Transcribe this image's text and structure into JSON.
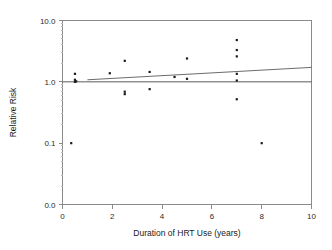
{
  "chart_data": {
    "type": "scatter",
    "title": "",
    "xlabel": "Duration of HRT Use (years)",
    "ylabel": "Relative Risk",
    "xlim": [
      0,
      10
    ],
    "ylim": [
      0.01,
      10.0
    ],
    "yscale": "log",
    "grid": false,
    "legend": null,
    "xticks": [
      0,
      2,
      4,
      6,
      8,
      10
    ],
    "xtick_labels": [
      "0",
      "2",
      "4",
      "6",
      "8",
      "10"
    ],
    "yticks": [
      10.0,
      1.0,
      0.1,
      0.01
    ],
    "ytick_labels": [
      "10.0",
      "1.0",
      "0.1",
      "0.0"
    ],
    "points": [
      {
        "x": 0.35,
        "y": 0.1
      },
      {
        "x": 0.5,
        "y": 1.35
      },
      {
        "x": 0.5,
        "y": 1.08
      },
      {
        "x": 0.5,
        "y": 1.0
      },
      {
        "x": 0.55,
        "y": 1.02
      },
      {
        "x": 1.9,
        "y": 1.38
      },
      {
        "x": 2.5,
        "y": 2.2
      },
      {
        "x": 2.5,
        "y": 0.69
      },
      {
        "x": 2.5,
        "y": 0.63
      },
      {
        "x": 3.5,
        "y": 1.45
      },
      {
        "x": 3.5,
        "y": 0.76
      },
      {
        "x": 4.5,
        "y": 1.2
      },
      {
        "x": 5.0,
        "y": 2.4
      },
      {
        "x": 5.0,
        "y": 1.12
      },
      {
        "x": 7.0,
        "y": 4.8
      },
      {
        "x": 7.0,
        "y": 3.3
      },
      {
        "x": 7.0,
        "y": 2.6
      },
      {
        "x": 7.0,
        "y": 1.35
      },
      {
        "x": 7.0,
        "y": 1.05
      },
      {
        "x": 7.0,
        "y": 0.52
      },
      {
        "x": 8.0,
        "y": 0.1
      }
    ],
    "reference_line": {
      "name": "null-effect-line",
      "y": 1.0,
      "x_start": 0,
      "x_end": 10
    },
    "fit_line": {
      "name": "trend-line",
      "x_start": 1.0,
      "y_start": 1.08,
      "x_end": 10.0,
      "y_end": 1.72
    },
    "colors": {
      "point": "#1a1a1a",
      "axis": "#8a8a8a",
      "fit_line": "#5a5a5a",
      "reference_line": "#4a4a4a",
      "background": "#ffffff"
    }
  }
}
